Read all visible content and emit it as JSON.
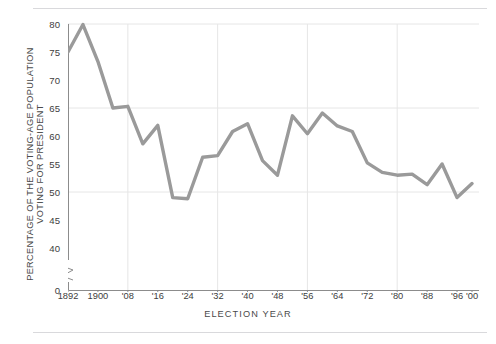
{
  "figure": {
    "ylabel_lines": [
      "PERCENTAGE OF THE VOTING-AGE POPULATION",
      "VOTING FOR PRESIDENT"
    ],
    "xlabel": "ELECTION  YEAR",
    "line_color": "#9a9a9a",
    "grid_color": "#e6e6e6",
    "axis_color": "#8c8c8c",
    "rule_color": "#d9d9dc",
    "text_color": "#3d3d3d"
  },
  "chart_data": {
    "type": "line",
    "title": "",
    "xlabel": "ELECTION  YEAR",
    "ylabel": "PERCENTAGE OF THE VOTING-AGE POPULATION VOTING FOR PRESIDENT",
    "xlim": [
      1892,
      2000
    ],
    "ylim": [
      40,
      80
    ],
    "y_axis_break": true,
    "y_break_from": 0,
    "y_break_to": 40,
    "grid": true,
    "grid_y_values": [
      50,
      65,
      80
    ],
    "grid_x_values": [
      1908,
      1932,
      1956,
      1980
    ],
    "legend": "none",
    "ytick_labels": [
      "0",
      "40",
      "45",
      "50",
      "55",
      "60",
      "65",
      "70",
      "75",
      "80"
    ],
    "ytick_values": [
      0,
      40,
      45,
      50,
      55,
      60,
      65,
      70,
      75,
      80
    ],
    "xtick_labels": [
      "1892",
      "1900",
      "'08",
      "'16",
      "'24",
      "'32",
      "'40",
      "'48",
      "'56",
      "'64",
      "'72",
      "'80",
      "'88",
      "'96",
      "'00"
    ],
    "xtick_values": [
      1892,
      1900,
      1908,
      1916,
      1924,
      1932,
      1940,
      1948,
      1956,
      1964,
      1972,
      1980,
      1988,
      1996,
      2000
    ],
    "x": [
      1892,
      1896,
      1900,
      1904,
      1908,
      1912,
      1916,
      1920,
      1924,
      1928,
      1932,
      1936,
      1940,
      1944,
      1948,
      1952,
      1956,
      1960,
      1964,
      1968,
      1972,
      1976,
      1980,
      1984,
      1988,
      1992,
      1996,
      2000
    ],
    "values": [
      75.0,
      79.9,
      73.3,
      65.0,
      65.3,
      58.6,
      61.9,
      49.0,
      48.8,
      56.2,
      56.5,
      60.8,
      62.2,
      55.6,
      53.0,
      63.6,
      60.4,
      64.1,
      61.8,
      60.8,
      55.2,
      53.5,
      53.0,
      53.2,
      51.3,
      55.0,
      49.0,
      51.5
    ],
    "series": [
      {
        "name": "Percentage of voting-age population voting for president",
        "values": [
          75.0,
          79.9,
          73.3,
          65.0,
          65.3,
          58.6,
          61.9,
          49.0,
          48.8,
          56.2,
          56.5,
          60.8,
          62.2,
          55.6,
          53.0,
          63.6,
          60.4,
          64.1,
          61.8,
          60.8,
          55.2,
          53.5,
          53.0,
          53.2,
          51.3,
          55.0,
          49.0,
          51.5
        ]
      }
    ]
  }
}
